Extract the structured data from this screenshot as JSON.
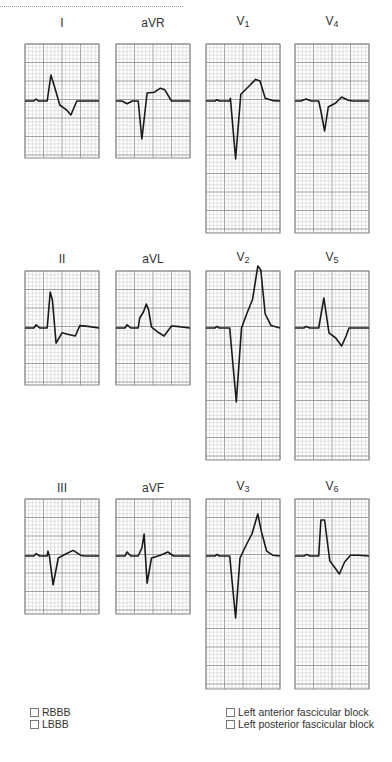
{
  "leads": [
    {
      "id": "I",
      "label": "I",
      "sub": "",
      "size": "short",
      "row": 0,
      "col": 0,
      "trace": [
        [
          0,
          0
        ],
        [
          0.12,
          0
        ],
        [
          0.15,
          0.05
        ],
        [
          0.18,
          0
        ],
        [
          0.3,
          0
        ],
        [
          0.35,
          0.65
        ],
        [
          0.4,
          0.35
        ],
        [
          0.47,
          -0.1
        ],
        [
          0.56,
          -0.22
        ],
        [
          0.62,
          -0.35
        ],
        [
          0.7,
          0
        ],
        [
          1,
          0
        ]
      ]
    },
    {
      "id": "aVR",
      "label": "aVR",
      "sub": "",
      "size": "short",
      "row": 0,
      "col": 1,
      "trace": [
        [
          0,
          0
        ],
        [
          0.08,
          0
        ],
        [
          0.15,
          -0.07
        ],
        [
          0.22,
          0
        ],
        [
          0.3,
          0
        ],
        [
          0.35,
          -0.95
        ],
        [
          0.42,
          0.2
        ],
        [
          0.52,
          0.22
        ],
        [
          0.6,
          0.32
        ],
        [
          0.66,
          0.28
        ],
        [
          0.75,
          0
        ],
        [
          1,
          0
        ]
      ]
    },
    {
      "id": "V1",
      "label": "V",
      "sub": "1",
      "size": "tall",
      "row": 0,
      "col": 2,
      "trace": [
        [
          0,
          0
        ],
        [
          0.12,
          0
        ],
        [
          0.15,
          0.03
        ],
        [
          0.18,
          0
        ],
        [
          0.32,
          0
        ],
        [
          0.33,
          0.07
        ],
        [
          0.4,
          -1.45
        ],
        [
          0.47,
          0.17
        ],
        [
          0.58,
          0.37
        ],
        [
          0.67,
          0.54
        ],
        [
          0.73,
          0.5
        ],
        [
          0.8,
          0.07
        ],
        [
          0.9,
          0.01
        ],
        [
          1,
          0
        ]
      ]
    },
    {
      "id": "V4",
      "label": "V",
      "sub": "4",
      "size": "tall",
      "row": 0,
      "col": 3,
      "trace": [
        [
          0,
          0
        ],
        [
          0.08,
          0
        ],
        [
          0.15,
          0.05
        ],
        [
          0.22,
          0
        ],
        [
          0.32,
          0
        ],
        [
          0.35,
          -0.25
        ],
        [
          0.4,
          -0.75
        ],
        [
          0.45,
          -0.15
        ],
        [
          0.55,
          -0.05
        ],
        [
          0.63,
          0.1
        ],
        [
          0.72,
          0.02
        ],
        [
          0.78,
          0
        ],
        [
          1,
          0
        ]
      ]
    },
    {
      "id": "II",
      "label": "II",
      "sub": "",
      "size": "short",
      "row": 1,
      "col": 0,
      "trace": [
        [
          0,
          0
        ],
        [
          0.12,
          0
        ],
        [
          0.15,
          0.08
        ],
        [
          0.2,
          0
        ],
        [
          0.3,
          0
        ],
        [
          0.34,
          0.9
        ],
        [
          0.37,
          0.7
        ],
        [
          0.42,
          -0.38
        ],
        [
          0.5,
          -0.12
        ],
        [
          0.56,
          -0.15
        ],
        [
          0.68,
          -0.2
        ],
        [
          0.74,
          0.06
        ],
        [
          0.85,
          0.04
        ],
        [
          1,
          0
        ]
      ]
    },
    {
      "id": "aVL",
      "label": "aVL",
      "sub": "",
      "size": "short",
      "row": 1,
      "col": 1,
      "trace": [
        [
          0,
          0
        ],
        [
          0.12,
          0
        ],
        [
          0.15,
          0.08
        ],
        [
          0.2,
          0
        ],
        [
          0.3,
          0
        ],
        [
          0.32,
          0.25
        ],
        [
          0.37,
          0.4
        ],
        [
          0.41,
          0.6
        ],
        [
          0.44,
          0.45
        ],
        [
          0.48,
          0.02
        ],
        [
          0.58,
          -0.12
        ],
        [
          0.65,
          -0.2
        ],
        [
          0.75,
          0.05
        ],
        [
          0.82,
          0.04
        ],
        [
          1,
          0
        ]
      ]
    },
    {
      "id": "V2",
      "label": "V",
      "sub": "2",
      "size": "tall",
      "row": 1,
      "col": 2,
      "trace": [
        [
          0,
          0
        ],
        [
          0.12,
          0
        ],
        [
          0.15,
          0.04
        ],
        [
          0.18,
          0
        ],
        [
          0.32,
          0
        ],
        [
          0.41,
          -1.85
        ],
        [
          0.48,
          0.0
        ],
        [
          0.55,
          0.35
        ],
        [
          0.63,
          0.72
        ],
        [
          0.7,
          1.55
        ],
        [
          0.74,
          1.45
        ],
        [
          0.8,
          0.35
        ],
        [
          0.88,
          0.06
        ],
        [
          1,
          0
        ]
      ]
    },
    {
      "id": "V5",
      "label": "V",
      "sub": "5",
      "size": "tall",
      "row": 1,
      "col": 3,
      "trace": [
        [
          0,
          0
        ],
        [
          0.12,
          0
        ],
        [
          0.15,
          0.04
        ],
        [
          0.2,
          0
        ],
        [
          0.32,
          0
        ],
        [
          0.39,
          0.75
        ],
        [
          0.46,
          -0.12
        ],
        [
          0.55,
          -0.25
        ],
        [
          0.63,
          -0.45
        ],
        [
          0.69,
          -0.2
        ],
        [
          0.73,
          0.0
        ],
        [
          0.85,
          0.0
        ],
        [
          1,
          0
        ]
      ]
    },
    {
      "id": "III",
      "label": "III",
      "sub": "",
      "size": "short",
      "row": 2,
      "col": 0,
      "trace": [
        [
          0,
          0
        ],
        [
          0.12,
          0
        ],
        [
          0.15,
          0.06
        ],
        [
          0.2,
          0
        ],
        [
          0.3,
          0
        ],
        [
          0.31,
          0.12
        ],
        [
          0.33,
          0
        ],
        [
          0.38,
          -0.72
        ],
        [
          0.45,
          -0.05
        ],
        [
          0.55,
          0.05
        ],
        [
          0.65,
          0.14
        ],
        [
          0.75,
          0.02
        ],
        [
          0.8,
          0
        ],
        [
          1,
          0
        ]
      ]
    },
    {
      "id": "aVF",
      "label": "aVF",
      "sub": "",
      "size": "short",
      "row": 2,
      "col": 1,
      "trace": [
        [
          0,
          0
        ],
        [
          0.12,
          0
        ],
        [
          0.15,
          0.1
        ],
        [
          0.2,
          0
        ],
        [
          0.3,
          0
        ],
        [
          0.35,
          0.2
        ],
        [
          0.38,
          0.55
        ],
        [
          0.42,
          -0.68
        ],
        [
          0.48,
          -0.05
        ],
        [
          0.6,
          0.02
        ],
        [
          0.7,
          0.1
        ],
        [
          0.78,
          0.0
        ],
        [
          1,
          0
        ]
      ]
    },
    {
      "id": "V3",
      "label": "V",
      "sub": "3",
      "size": "tall",
      "row": 2,
      "col": 2,
      "trace": [
        [
          0,
          0
        ],
        [
          0.12,
          0
        ],
        [
          0.15,
          0.04
        ],
        [
          0.18,
          0
        ],
        [
          0.32,
          0
        ],
        [
          0.4,
          -1.55
        ],
        [
          0.46,
          -0.05
        ],
        [
          0.55,
          0.3
        ],
        [
          0.62,
          0.55
        ],
        [
          0.7,
          1.05
        ],
        [
          0.75,
          0.6
        ],
        [
          0.82,
          0.12
        ],
        [
          0.9,
          0.02
        ],
        [
          1,
          0
        ]
      ]
    },
    {
      "id": "V6",
      "label": "V",
      "sub": "6",
      "size": "tall",
      "row": 2,
      "col": 3,
      "trace": [
        [
          0,
          0
        ],
        [
          0.12,
          0
        ],
        [
          0.16,
          0.04
        ],
        [
          0.2,
          0
        ],
        [
          0.32,
          0
        ],
        [
          0.35,
          0.9
        ],
        [
          0.4,
          0.9
        ],
        [
          0.47,
          -0.12
        ],
        [
          0.6,
          -0.45
        ],
        [
          0.67,
          -0.15
        ],
        [
          0.75,
          0.02
        ],
        [
          0.85,
          0.02
        ],
        [
          1,
          0
        ]
      ]
    }
  ],
  "checkboxes": {
    "left": [
      {
        "label": "RBBB",
        "checked": false
      },
      {
        "label": "LBBB",
        "checked": false
      }
    ],
    "right": [
      {
        "label": "Left anterior fascicular block",
        "checked": false
      },
      {
        "label": "Left posterior fascicular block",
        "checked": false
      }
    ]
  },
  "colors": {
    "trace": "#1a1a1a",
    "grid_minor": "#c8c8c8",
    "grid_major": "#8a8a8a",
    "border": "#8a8a8a"
  }
}
